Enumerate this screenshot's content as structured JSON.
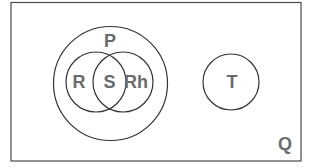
{
  "diagram": {
    "type": "venn",
    "universe": {
      "id": "Q",
      "label": "Q"
    },
    "sets": [
      {
        "id": "P",
        "label": "P",
        "parent": "Q"
      },
      {
        "id": "R",
        "label": "R",
        "parent": "P"
      },
      {
        "id": "Rh",
        "label": "Rh",
        "parent": "P"
      },
      {
        "id": "T",
        "label": "T",
        "parent": "Q"
      }
    ],
    "regions": [
      {
        "id": "S",
        "label": "S",
        "intersection_of": [
          "R",
          "Rh"
        ]
      }
    ],
    "colors": {
      "stroke": "#333333",
      "label": "#6b6b6b",
      "background": "#ffffff"
    }
  }
}
